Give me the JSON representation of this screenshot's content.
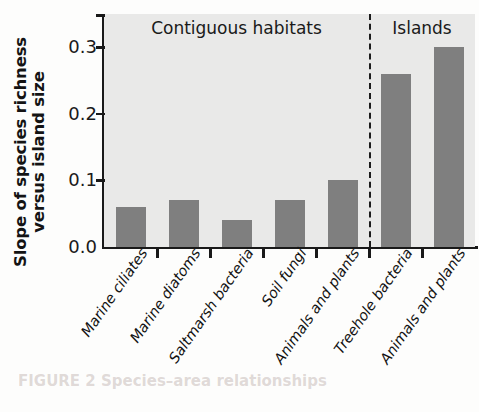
{
  "chart_data": {
    "type": "bar",
    "title": "",
    "xlabel": "",
    "ylabel_line1": "Slope of species richness",
    "ylabel_line2": "versus island size",
    "ylim": [
      0.0,
      0.35
    ],
    "yticks": [
      0.0,
      0.1,
      0.2,
      0.3
    ],
    "ytick_labels": [
      "0.0",
      "0.1",
      "0.2",
      "0.3"
    ],
    "grid": false,
    "legend": "none",
    "bar_color": "#7f7f7f",
    "plot_background": "#e9e9e8",
    "axis_color": "#191919",
    "categories": [
      "Marine ciliates",
      "Marine diatoms",
      "Saltmarsh bacteria",
      "Soil fungi",
      "Animals and plants",
      "Treehole bacteria",
      "Animals and plants"
    ],
    "values": [
      0.06,
      0.07,
      0.04,
      0.07,
      0.1,
      0.26,
      0.3
    ],
    "groups": [
      {
        "label": "Contiguous habitats",
        "from_index": 0,
        "to_index": 4
      },
      {
        "label": "Islands",
        "from_index": 5,
        "to_index": 6
      }
    ],
    "divider": {
      "after_index": 4,
      "style": "dashed",
      "color": "#1c1c1c"
    }
  },
  "artifact": {
    "bleed_text": "FIGURE 2  Species–area relationships"
  }
}
